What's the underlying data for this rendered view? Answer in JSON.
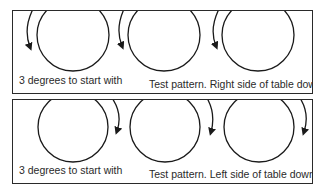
{
  "panels": [
    {
      "id": "top",
      "left_caption": "3 degrees to start with",
      "right_caption": "Test pattern. Right side of table down.",
      "arrow_side": "left"
    },
    {
      "id": "bottom",
      "left_caption": "3 degrees to start with",
      "right_caption": "Test pattern. Left side of table down.",
      "arrow_side": "right"
    }
  ],
  "colors": {
    "stroke": "#1a1a1a",
    "text": "#2a2a2a",
    "background": "#ffffff"
  }
}
